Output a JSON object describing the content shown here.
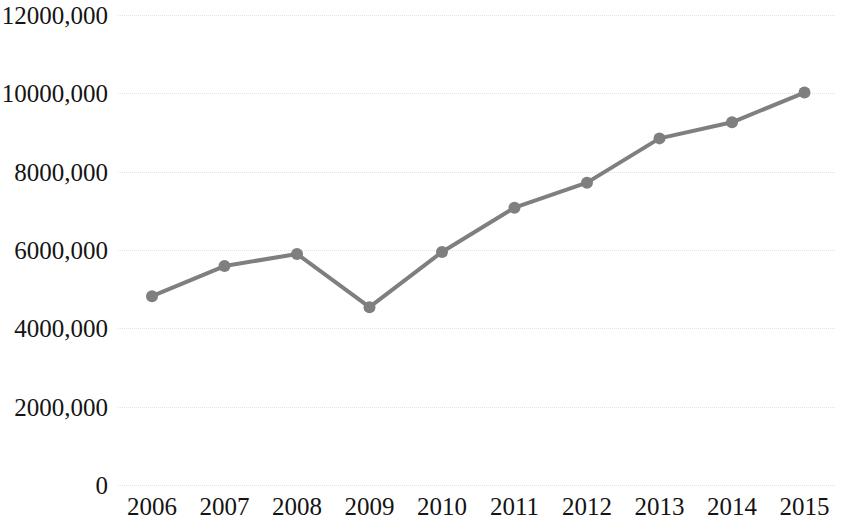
{
  "chart_data": {
    "type": "line",
    "title": "",
    "subtitle": "",
    "xlabel": "",
    "ylabel": "",
    "categories": [
      "2006",
      "2007",
      "2008",
      "2009",
      "2010",
      "2011",
      "2012",
      "2013",
      "2014",
      "2015"
    ],
    "x": [
      2006,
      2007,
      2008,
      2009,
      2010,
      2011,
      2012,
      2013,
      2014,
      2015
    ],
    "series": [
      {
        "name": "",
        "values": [
          4820000,
          5590000,
          5900000,
          4540000,
          5950000,
          7080000,
          7720000,
          8850000,
          9260000,
          10020000
        ]
      }
    ],
    "values": [
      4820000,
      5590000,
      5900000,
      4540000,
      5950000,
      7080000,
      7720000,
      8850000,
      9260000,
      10020000
    ],
    "ylim": [
      0,
      12000000
    ],
    "ytick_values": [
      0,
      2000000,
      4000000,
      6000000,
      8000000,
      10000000,
      12000000
    ],
    "ytick_labels": [
      "0",
      "2000,000",
      "4000,000",
      "6000,000",
      "8000,000",
      "10000,000",
      "12000,000"
    ],
    "grid": true,
    "grid_axis": "y",
    "grid_style": "dotted",
    "legend": false,
    "legend_position": "none",
    "marker": "circle",
    "marker_size": 12,
    "line_color": "#7f7f7f",
    "marker_color": "#7f7f7f",
    "grid_color": "#e2e2e2",
    "background_color": "#ffffff",
    "text_color": "#141414",
    "line_width": 4
  }
}
